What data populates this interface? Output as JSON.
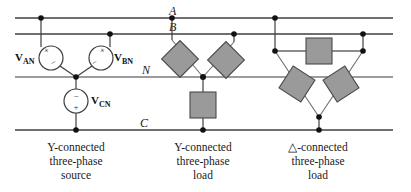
{
  "figure": {
    "kind": "three-phase-circuit-diagram",
    "background_color": "#ffffff",
    "wire_color": "#3f3f3f",
    "node_color": "#111111",
    "load_fill_color": "#9a9a9a",
    "load_stroke_color": "#4a4a4a"
  },
  "buses": {
    "a": {
      "label": "A",
      "y": 18
    },
    "b": {
      "label": "B",
      "y": 34
    },
    "n": {
      "label": "N",
      "y": 77
    },
    "c": {
      "label": "C",
      "y": 130
    }
  },
  "sources": {
    "van": {
      "label": "V",
      "sub": "AN",
      "plus": "+",
      "minus": "−"
    },
    "vbn": {
      "label": "V",
      "sub": "BN",
      "plus": "+",
      "minus": "−"
    },
    "vcn": {
      "label": "V",
      "sub": "CN",
      "plus": "+",
      "minus": "−"
    }
  },
  "captions": [
    {
      "line1": "Y-connected",
      "line2": "three-phase",
      "line3": "source",
      "x": 76
    },
    {
      "line1": "Y-connected",
      "line2": "three-phase",
      "line3": "load",
      "x": 203
    },
    {
      "line1": "△-connected",
      "line2": "three-phase",
      "line3": "load",
      "x": 318
    }
  ]
}
